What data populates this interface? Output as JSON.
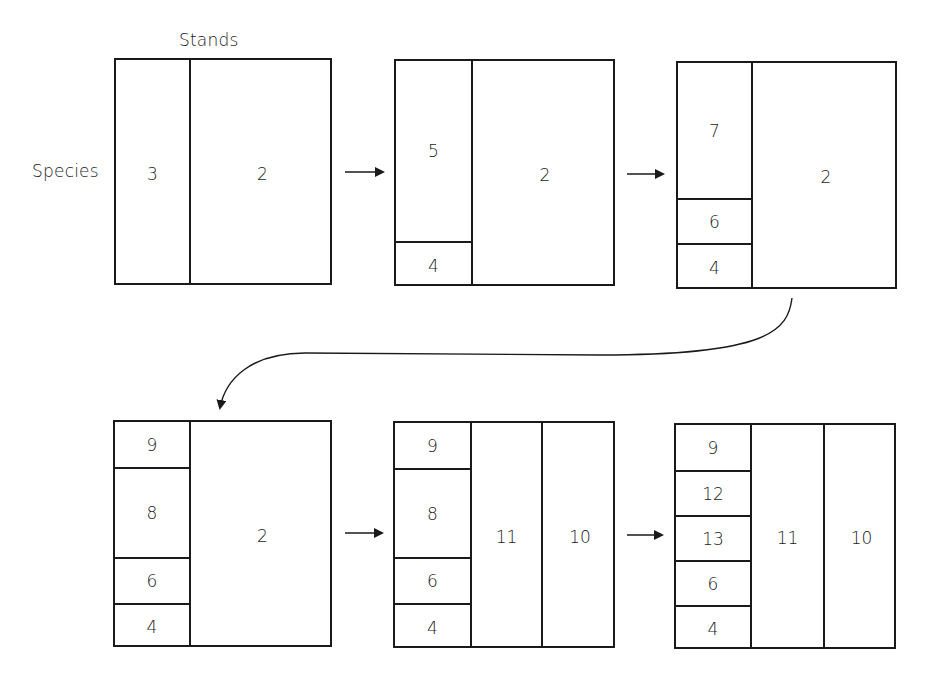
{
  "axis_labels": {
    "stands": "Stands",
    "species": "Species"
  },
  "panels": [
    {
      "id": "step-1",
      "box": {
        "x": 114,
        "y": 58,
        "w": 218,
        "h": 227
      },
      "columns": [
        {
          "width": 73,
          "cells": [
            {
              "label": "3",
              "height": 227
            }
          ]
        },
        {
          "width": 145,
          "cells": [
            {
              "label": "2",
              "height": 227
            }
          ]
        }
      ]
    },
    {
      "id": "step-2",
      "box": {
        "x": 394,
        "y": 59,
        "w": 221,
        "h": 227
      },
      "columns": [
        {
          "width": 75,
          "cells": [
            {
              "label": "5",
              "height": 180
            },
            {
              "label": "4",
              "height": 47
            }
          ]
        },
        {
          "width": 146,
          "cells": [
            {
              "label": "2",
              "height": 227
            }
          ]
        }
      ]
    },
    {
      "id": "step-3",
      "box": {
        "x": 676,
        "y": 61,
        "w": 221,
        "h": 228
      },
      "columns": [
        {
          "width": 73,
          "cells": [
            {
              "label": "7",
              "height": 135
            },
            {
              "label": "6",
              "height": 45
            },
            {
              "label": "4",
              "height": 48
            }
          ]
        },
        {
          "width": 148,
          "cells": [
            {
              "label": "2",
              "height": 228
            }
          ]
        }
      ]
    },
    {
      "id": "step-4",
      "box": {
        "x": 113,
        "y": 420,
        "w": 219,
        "h": 227
      },
      "columns": [
        {
          "width": 74,
          "cells": [
            {
              "label": "9",
              "height": 45
            },
            {
              "label": "8",
              "height": 90
            },
            {
              "label": "6",
              "height": 46
            },
            {
              "label": "4",
              "height": 46
            }
          ]
        },
        {
          "width": 145,
          "cells": [
            {
              "label": "2",
              "height": 227
            }
          ]
        }
      ]
    },
    {
      "id": "step-5",
      "box": {
        "x": 393,
        "y": 421,
        "w": 222,
        "h": 227
      },
      "columns": [
        {
          "width": 75,
          "cells": [
            {
              "label": "9",
              "height": 45
            },
            {
              "label": "8",
              "height": 89
            },
            {
              "label": "6",
              "height": 46
            },
            {
              "label": "4",
              "height": 47
            }
          ]
        },
        {
          "width": 71,
          "cells": [
            {
              "label": "11",
              "height": 227
            }
          ]
        },
        {
          "width": 76,
          "cells": [
            {
              "label": "10",
              "height": 227
            }
          ]
        }
      ]
    },
    {
      "id": "step-6",
      "box": {
        "x": 674,
        "y": 423,
        "w": 222,
        "h": 226
      },
      "columns": [
        {
          "width": 74,
          "cells": [
            {
              "label": "9",
              "height": 45
            },
            {
              "label": "12",
              "height": 45
            },
            {
              "label": "13",
              "height": 45
            },
            {
              "label": "6",
              "height": 45
            },
            {
              "label": "4",
              "height": 46
            }
          ]
        },
        {
          "width": 73,
          "cells": [
            {
              "label": "11",
              "height": 226
            }
          ]
        },
        {
          "width": 75,
          "cells": [
            {
              "label": "10",
              "height": 226
            }
          ]
        }
      ]
    }
  ],
  "arrows": [
    {
      "id": "arrow-1-2",
      "x1": 345,
      "y1": 172,
      "x2": 383,
      "y2": 172
    },
    {
      "id": "arrow-2-3",
      "x1": 627,
      "y1": 174,
      "x2": 663,
      "y2": 174
    },
    {
      "id": "arrow-4-5",
      "x1": 345,
      "y1": 533,
      "x2": 382,
      "y2": 533
    },
    {
      "id": "arrow-5-6",
      "x1": 627,
      "y1": 535,
      "x2": 662,
      "y2": 535
    }
  ],
  "curved_arrow": {
    "id": "arrow-3-4",
    "path": "M 792 298 C 788 330, 770 355, 600 355 L 305 353 C 250 353, 225 380, 220 408"
  },
  "colors": {
    "line": "#1a1a1a",
    "background": "#ffffff"
  }
}
